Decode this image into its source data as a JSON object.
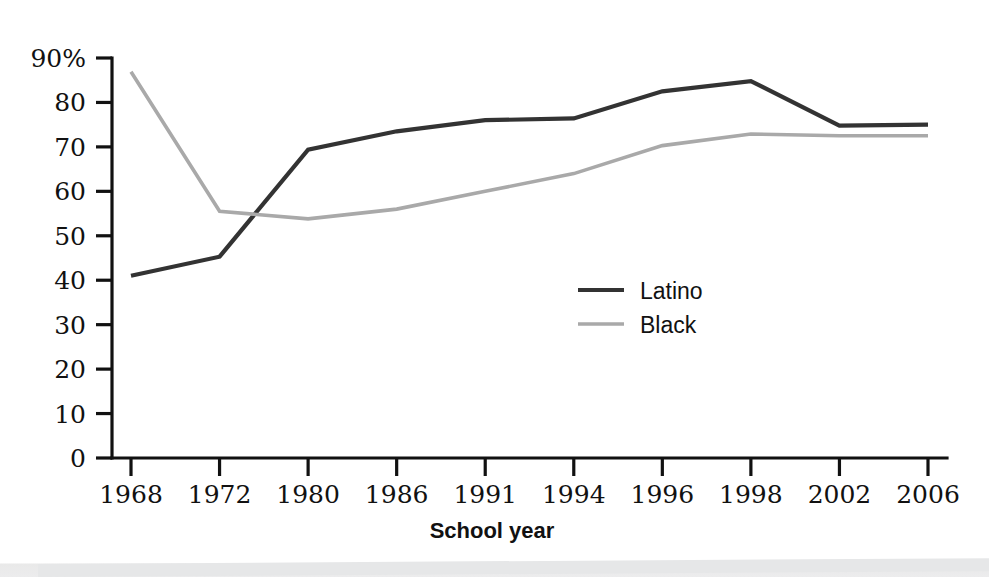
{
  "chart_data": {
    "type": "line",
    "title": "",
    "subtitle": "",
    "xlabel": "School year",
    "ylabel": "",
    "categories": [
      "1968",
      "1972",
      "1980",
      "1986",
      "1991",
      "1994",
      "1996",
      "1998",
      "2002",
      "2006"
    ],
    "series": [
      {
        "name": "Latino",
        "color": "#333333",
        "values": [
          41.0,
          45.3,
          69.4,
          73.5,
          76.0,
          76.4,
          82.5,
          84.8,
          74.8,
          75.0
        ]
      },
      {
        "name": "Black",
        "color": "#a9a9a9",
        "values": [
          86.9,
          55.5,
          53.8,
          56.0,
          60.0,
          64.0,
          70.3,
          72.9,
          72.5,
          72.5
        ]
      }
    ],
    "ylim": [
      0,
      90
    ],
    "yticks": [
      0,
      10,
      20,
      30,
      40,
      50,
      60,
      70,
      80,
      90
    ],
    "ytick_labels": [
      "0",
      "10",
      "20",
      "30",
      "40",
      "50",
      "60",
      "70",
      "80",
      "90%"
    ],
    "grid": false,
    "legend_position": "center"
  },
  "axes": {
    "x_axis_title": "School year"
  },
  "legend": {
    "entries": [
      {
        "label": "Latino",
        "color": "#333333"
      },
      {
        "label": "Black",
        "color": "#a9a9a9"
      }
    ]
  }
}
